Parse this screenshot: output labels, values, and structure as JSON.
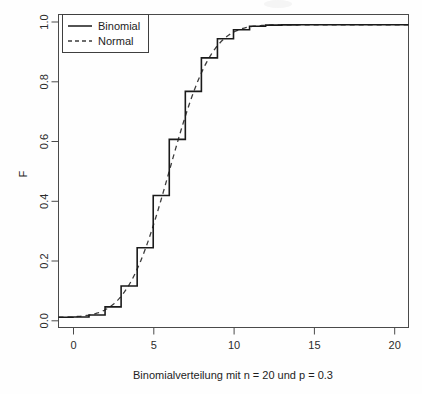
{
  "chart_data": {
    "type": "line",
    "title": "",
    "xlabel": "Binomialverteilung mit n = 20 und p = 0.3",
    "ylabel": "F",
    "xlim": [
      -0.9,
      20.9
    ],
    "ylim": [
      -0.035,
      1.035
    ],
    "xticks": [
      0,
      5,
      10,
      15,
      20
    ],
    "xticklabels": [
      "0",
      "5",
      "10",
      "15",
      "20"
    ],
    "yticks": [
      0.0,
      0.2,
      0.4,
      0.6,
      0.8,
      1.0
    ],
    "yticklabels": [
      "0.0",
      "0.2",
      "0.4",
      "0.6",
      "0.8",
      "1.0"
    ],
    "grid": false,
    "legend_position": "top-left",
    "x": [
      0,
      1,
      2,
      3,
      4,
      5,
      6,
      7,
      8,
      9,
      10,
      11,
      12,
      13,
      14,
      15,
      16,
      17,
      18,
      19,
      20
    ],
    "series": [
      {
        "name": "Binomial",
        "style": "step",
        "linestyle": "solid",
        "values": [
          0.0008,
          0.0076,
          0.0355,
          0.1071,
          0.2375,
          0.4164,
          0.608,
          0.7723,
          0.8867,
          0.952,
          0.9829,
          0.9949,
          0.9987,
          0.9997,
          1.0,
          1.0,
          1.0,
          1.0,
          1.0,
          1.0,
          1.0
        ]
      },
      {
        "name": "Normal",
        "style": "line",
        "linestyle": "dashed",
        "values": [
          0.0074,
          0.0274,
          0.0786,
          0.1769,
          0.3232,
          0.5,
          0.6768,
          0.8231,
          0.9214,
          0.9726,
          0.9926,
          0.9984,
          0.9997,
          0.9999,
          1.0,
          1.0,
          1.0,
          1.0,
          1.0,
          1.0,
          1.0
        ]
      }
    ]
  },
  "legend": {
    "items": [
      {
        "label": "Binomial",
        "linestyle": "solid"
      },
      {
        "label": "Normal",
        "linestyle": "dashed"
      }
    ]
  },
  "axes": {
    "y_title": "F",
    "x_title": "Binomialverteilung mit n = 20 und p = 0.3"
  },
  "colors": {
    "binomial": "#1a1a1a",
    "normal": "#3d3d3d",
    "axis": "#4a4a4a",
    "background": "#fefefe"
  }
}
